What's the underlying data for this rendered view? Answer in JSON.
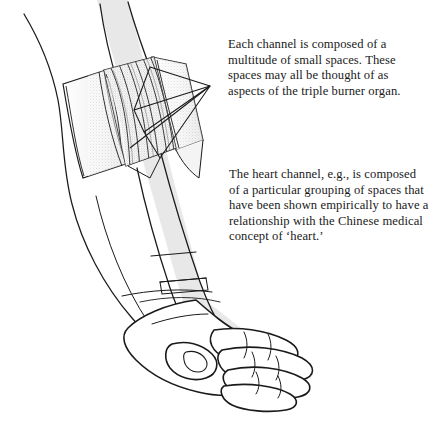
{
  "figure": {
    "background_color": "#ffffff",
    "ink_color": "#1a1a1a",
    "band_color": "#e8e8e8",
    "shading_color": "#9a9a9a"
  },
  "annotations": [
    {
      "id": "annotation-1",
      "text": "Each channel is composed of a multitude of small spaces. These spaces may all be thought of as aspects of the triple burner organ."
    },
    {
      "id": "annotation-2",
      "text": "The heart channel, e.g., is composed of a particular grouping of spaces that have been shown empirically to have a relationship with the Chinese medical concept of ‘heart.’"
    }
  ],
  "illustration_parts": {
    "arm_outline": "forearm-outline",
    "channel_band": "translucent-gray-channel-band",
    "skin_flap_left": "reflected-skin-flap-left",
    "skin_flap_right": "reflected-skin-flap-right",
    "muscle_window": "exposed-muscle-fascicles",
    "wedge": "triangular-wedge-pointer",
    "hand": "hand-with-curled-fingers",
    "thumb": "thumb-with-nail",
    "wrist_creases": "wrist-crease-lines"
  }
}
